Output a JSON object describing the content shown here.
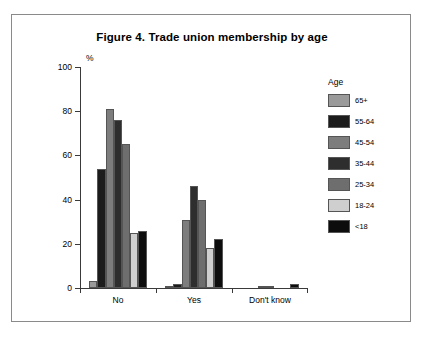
{
  "figure": {
    "title": "Figure 4. Trade union membership by age",
    "percent_symbol": "%"
  },
  "legend": {
    "title": "Age",
    "entries": [
      {
        "label": "65+",
        "color": "#9a9a9a"
      },
      {
        "label": "55-64",
        "color": "#1c1c1c"
      },
      {
        "label": "45-54",
        "color": "#7d7d7d"
      },
      {
        "label": "35-44",
        "color": "#2e2e2e"
      },
      {
        "label": "25-34",
        "color": "#6e6e6e"
      },
      {
        "label": "18-24",
        "color": "#cfcfcf"
      },
      {
        "label": "<18",
        "color": "#0d0d0d"
      }
    ]
  },
  "chart_data": {
    "type": "bar",
    "title": "Figure 4. Trade union membership by age",
    "xlabel": "",
    "ylabel": "%",
    "ylim": [
      0,
      100
    ],
    "yticks": [
      0,
      20,
      40,
      60,
      80,
      100
    ],
    "grid": false,
    "legend_position": "right",
    "legend_title": "Age",
    "categories": [
      "No",
      "Yes",
      "Don't know"
    ],
    "series": [
      {
        "name": "65+",
        "color": "#9a9a9a",
        "values": [
          3,
          1,
          0
        ]
      },
      {
        "name": "55-64",
        "color": "#1c1c1c",
        "values": [
          54,
          2,
          0
        ]
      },
      {
        "name": "45-54",
        "color": "#7d7d7d",
        "values": [
          81,
          31,
          1
        ]
      },
      {
        "name": "35-44",
        "color": "#2e2e2e",
        "values": [
          76,
          46,
          1
        ]
      },
      {
        "name": "25-34",
        "color": "#6e6e6e",
        "values": [
          65,
          40,
          0
        ]
      },
      {
        "name": "18-24",
        "color": "#cfcfcf",
        "values": [
          25,
          18,
          0
        ]
      },
      {
        "name": "<18",
        "color": "#0d0d0d",
        "values": [
          26,
          22,
          2
        ]
      }
    ]
  }
}
